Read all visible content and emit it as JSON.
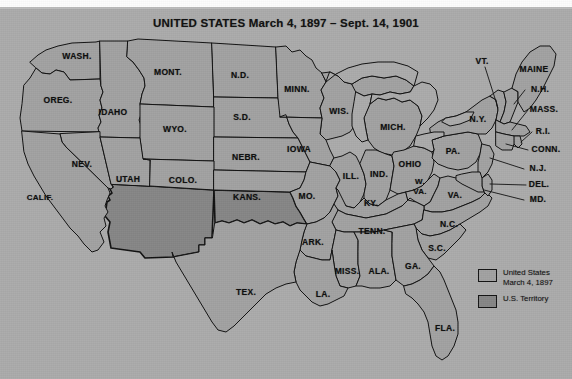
{
  "title": "UNITED STATES March 4, 1897 – Sept. 14, 1901",
  "colors": {
    "background": "#ababab",
    "state_fill": "#a2a2a2",
    "territory_fill": "#868686",
    "water_fill": "#ababab",
    "border": "#111111",
    "text": "#0d0d0d"
  },
  "legend": {
    "items": [
      {
        "swatch": "us",
        "line1": "United States",
        "line2": "March 4, 1897"
      },
      {
        "swatch": "territory",
        "line1": "U.S. Territory",
        "line2": ""
      }
    ]
  },
  "states": [
    {
      "label": "WASH.",
      "x": 77,
      "y": 57,
      "kind": "state"
    },
    {
      "label": "OREG.",
      "x": 58,
      "y": 101,
      "kind": "state"
    },
    {
      "label": "IDAHO",
      "x": 113,
      "y": 113,
      "kind": "state"
    },
    {
      "label": "MONT.",
      "x": 168,
      "y": 73,
      "kind": "state"
    },
    {
      "label": "N.D.",
      "x": 240,
      "y": 76,
      "kind": "state"
    },
    {
      "label": "S.D.",
      "x": 242,
      "y": 118,
      "kind": "state"
    },
    {
      "label": "MINN.",
      "x": 297,
      "y": 90,
      "kind": "state"
    },
    {
      "label": "WIS.",
      "x": 339,
      "y": 112,
      "kind": "state"
    },
    {
      "label": "MICH.",
      "x": 393,
      "y": 128,
      "kind": "state"
    },
    {
      "label": "WYO.",
      "x": 175,
      "y": 130,
      "kind": "state"
    },
    {
      "label": "NEBR.",
      "x": 246,
      "y": 158,
      "kind": "state"
    },
    {
      "label": "IOWA",
      "x": 299,
      "y": 150,
      "kind": "state"
    },
    {
      "label": "NEV.",
      "x": 82,
      "y": 165,
      "kind": "state"
    },
    {
      "label": "UTAH",
      "x": 128,
      "y": 180,
      "kind": "state"
    },
    {
      "label": "COLO.",
      "x": 183,
      "y": 181,
      "kind": "state"
    },
    {
      "label": "CALIF.",
      "x": 40,
      "y": 198,
      "kind": "state"
    },
    {
      "label": "KANS.",
      "x": 247,
      "y": 198,
      "kind": "state"
    },
    {
      "label": "MO.",
      "x": 307,
      "y": 197,
      "kind": "state"
    },
    {
      "label": "ILL.",
      "x": 351,
      "y": 177,
      "kind": "state"
    },
    {
      "label": "IND.",
      "x": 379,
      "y": 175,
      "kind": "state"
    },
    {
      "label": "OHIO",
      "x": 410,
      "y": 165,
      "kind": "state"
    },
    {
      "label": "PA.",
      "x": 453,
      "y": 152,
      "kind": "state"
    },
    {
      "label": "N.Y.",
      "x": 478,
      "y": 120,
      "kind": "state"
    },
    {
      "label": "KY.",
      "x": 371,
      "y": 204,
      "kind": "state"
    },
    {
      "label": "W.\nVA.",
      "x": 420,
      "y": 186,
      "kind": "state"
    },
    {
      "label": "VA.",
      "x": 455,
      "y": 196,
      "kind": "state"
    },
    {
      "label": "TENN.",
      "x": 372,
      "y": 232,
      "kind": "state"
    },
    {
      "label": "N.C.",
      "x": 449,
      "y": 225,
      "kind": "state"
    },
    {
      "label": "S.C.",
      "x": 437,
      "y": 249,
      "kind": "state"
    },
    {
      "label": "ARK.",
      "x": 313,
      "y": 243,
      "kind": "state"
    },
    {
      "label": "MISS.",
      "x": 347,
      "y": 272,
      "kind": "state"
    },
    {
      "label": "ALA.",
      "x": 379,
      "y": 272,
      "kind": "state"
    },
    {
      "label": "GA.",
      "x": 413,
      "y": 267,
      "kind": "state"
    },
    {
      "label": "LA.",
      "x": 323,
      "y": 295,
      "kind": "state"
    },
    {
      "label": "TEX.",
      "x": 246,
      "y": 293,
      "kind": "state"
    },
    {
      "label": "FLA.",
      "x": 445,
      "y": 329,
      "kind": "state"
    },
    {
      "label": "VT.",
      "x": 482,
      "y": 62,
      "kind": "state"
    },
    {
      "label": "MAINE",
      "x": 534,
      "y": 70,
      "kind": "state"
    },
    {
      "label": "N.H.",
      "x": 540,
      "y": 90,
      "kind": "state"
    },
    {
      "label": "MASS.",
      "x": 544,
      "y": 110,
      "kind": "state"
    },
    {
      "label": "R.I.",
      "x": 543,
      "y": 132,
      "kind": "state"
    },
    {
      "label": "CONN.",
      "x": 546,
      "y": 150,
      "kind": "state"
    },
    {
      "label": "N.J.",
      "x": 538,
      "y": 169,
      "kind": "state"
    },
    {
      "label": "DEL.",
      "x": 539,
      "y": 185,
      "kind": "state"
    },
    {
      "label": "MD.",
      "x": 538,
      "y": 200,
      "kind": "state"
    }
  ],
  "territories": [
    {
      "name": "arizona-new-mexico-territory"
    },
    {
      "name": "oklahoma-indian-territory"
    }
  ]
}
